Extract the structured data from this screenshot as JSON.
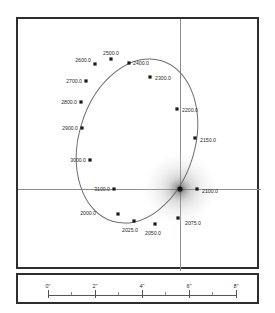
{
  "figure": {
    "type": "orbit-plot",
    "title": ""
  },
  "chart_data": {
    "type": "scatter",
    "title": "",
    "xlabel": "",
    "ylabel": "",
    "grid": false,
    "legend": null,
    "axis_unit": "arcsec",
    "primary_star": {
      "label": "",
      "x_px": 178,
      "y_px": 187
    },
    "crosshair": {
      "vertical_x_px": 178,
      "horizontal_y_px": 187
    },
    "epochs": [
      {
        "label": "2000.0",
        "x": 116,
        "y": 212,
        "lx": 94,
        "ly": 211,
        "anchor": "end"
      },
      {
        "label": "2025.0",
        "x": 132,
        "y": 219,
        "lx": 128,
        "ly": 228,
        "anchor": "middle"
      },
      {
        "label": "2050.0",
        "x": 153,
        "y": 222,
        "lx": 151,
        "ly": 231,
        "anchor": "middle"
      },
      {
        "label": "2075.0",
        "x": 176,
        "y": 216,
        "lx": 183,
        "ly": 221,
        "anchor": "start"
      },
      {
        "label": "2100.0",
        "x": 195,
        "y": 187,
        "lx": 200,
        "ly": 189,
        "anchor": "start"
      },
      {
        "label": "2150.0",
        "x": 193,
        "y": 136,
        "lx": 198,
        "ly": 138,
        "anchor": "start"
      },
      {
        "label": "2200.0",
        "x": 175,
        "y": 107,
        "lx": 180,
        "ly": 108,
        "anchor": "start"
      },
      {
        "label": "2300.0",
        "x": 148,
        "y": 75,
        "lx": 153,
        "ly": 76,
        "anchor": "start"
      },
      {
        "label": "2400.0",
        "x": 127,
        "y": 61,
        "lx": 131,
        "ly": 61,
        "anchor": "start"
      },
      {
        "label": "2500.0",
        "x": 109,
        "y": 57,
        "lx": 109,
        "ly": 51,
        "anchor": "middle"
      },
      {
        "label": "2600.0",
        "x": 93,
        "y": 62,
        "lx": 89,
        "ly": 58,
        "anchor": "end"
      },
      {
        "label": "2700.0",
        "x": 84,
        "y": 79,
        "lx": 80,
        "ly": 79,
        "anchor": "end"
      },
      {
        "label": "2800.0",
        "x": 79,
        "y": 100,
        "lx": 75,
        "ly": 100,
        "anchor": "end"
      },
      {
        "label": "2900.0",
        "x": 80,
        "y": 126,
        "lx": 76,
        "ly": 126,
        "anchor": "end"
      },
      {
        "label": "3000.0",
        "x": 88,
        "y": 158,
        "lx": 84,
        "ly": 158,
        "anchor": "end"
      },
      {
        "label": "3100.0",
        "x": 112,
        "y": 187,
        "lx": 108,
        "ly": 187,
        "anchor": "end"
      }
    ],
    "orbit_ellipse": {
      "cx": 135,
      "cy": 139,
      "rx": 58,
      "ry": 84,
      "rotation_deg": 17
    }
  },
  "scale": {
    "unit_suffix": "\"",
    "ticks": [
      {
        "label": "0\"",
        "value": 0,
        "x": 46
      },
      {
        "label": "2\"",
        "value": 2,
        "x": 93
      },
      {
        "label": "4\"",
        "value": 4,
        "x": 140
      },
      {
        "label": "6\"",
        "value": 6,
        "x": 187
      },
      {
        "label": "8\"",
        "value": 8,
        "x": 234
      }
    ],
    "minor_ticks_x": [
      69,
      116,
      163,
      210
    ]
  }
}
